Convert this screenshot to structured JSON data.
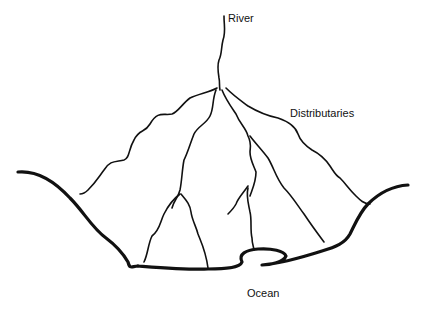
{
  "diagram": {
    "labels": {
      "river": "River",
      "distributaries": "Distributaries",
      "ocean": "Ocean"
    },
    "colors": {
      "line": "#111111",
      "background": "#ffffff"
    }
  }
}
